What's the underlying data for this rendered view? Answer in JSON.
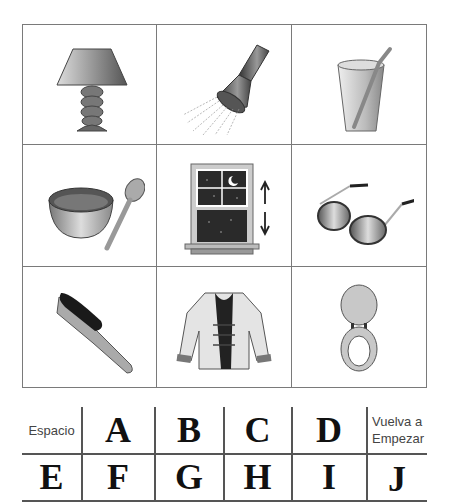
{
  "picture_grid": {
    "items": [
      {
        "id": "lamp",
        "label": "lamp"
      },
      {
        "id": "shower",
        "label": "shower head"
      },
      {
        "id": "glass",
        "label": "glass with straw"
      },
      {
        "id": "bowl",
        "label": "bowl and spoon"
      },
      {
        "id": "window",
        "label": "window"
      },
      {
        "id": "sunglasses",
        "label": "sunglasses"
      },
      {
        "id": "brush",
        "label": "brush"
      },
      {
        "id": "jacket",
        "label": "jacket"
      },
      {
        "id": "toilet-seat",
        "label": "toilet seat"
      }
    ]
  },
  "keyboard": {
    "row1": [
      "Espacio",
      "A",
      "B",
      "C",
      "D",
      "Vuelva a Empezar"
    ],
    "row2": [
      "E",
      "F",
      "G",
      "H",
      "I",
      "J"
    ],
    "space_label": "Espacio",
    "restart_line1": "Vuelva a",
    "restart_line2": "Empezar"
  }
}
